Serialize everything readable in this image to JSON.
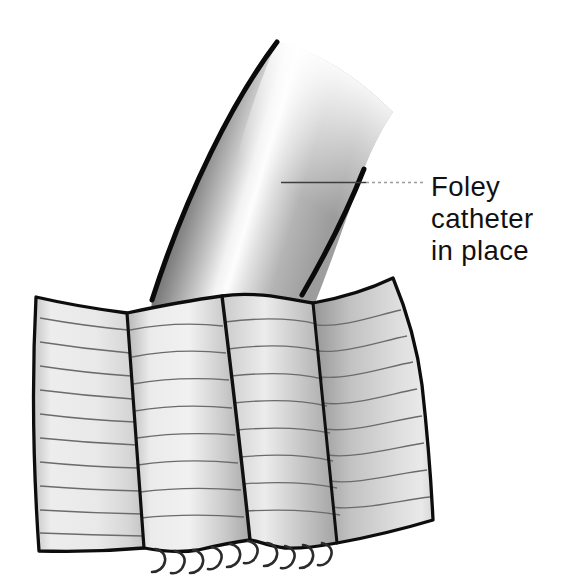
{
  "figure": {
    "label": {
      "line1": "Foley",
      "line2": "catheter",
      "line3": "in place"
    },
    "suture_count": 10
  },
  "colors": {
    "background": "#ffffff",
    "outline": "#0d0d0d",
    "tube_dark": "#2f2f2f",
    "tube_mid_gray": "#9c9c9c",
    "tube_highlight": "#fdfdfd",
    "tissue_light": "#efefef",
    "tissue_shadow": "#a2a2a2",
    "striation_line": "#6b6b6b",
    "suture": "#2b2b2b",
    "leader_line_dark": "#3d3d3d",
    "leader_line_light": "#9b9b9b",
    "label_text": "#111111"
  }
}
